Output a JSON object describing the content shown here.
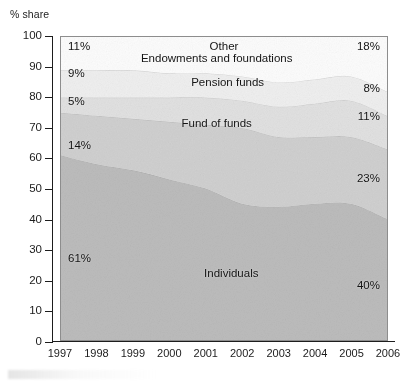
{
  "y_axis_title": "% share",
  "axis": {
    "y_ticks": [
      "0",
      "10",
      "20",
      "30",
      "40",
      "50",
      "60",
      "70",
      "80",
      "90",
      "100"
    ],
    "x_ticks": [
      "1997",
      "1998",
      "1999",
      "2000",
      "2001",
      "2002",
      "2003",
      "2004",
      "2005",
      "2006"
    ]
  },
  "labels": {
    "other": "Other",
    "endowments": "Endowments and foundations",
    "pension": "Pension funds",
    "fund_of_funds": "Fund of funds",
    "individuals": "Individuals"
  },
  "value_labels": {
    "other_start": "11%",
    "other_end": "18%",
    "endowments_start": "9%",
    "endowments_end": "8%",
    "pension_start": "5%",
    "pension_end": "11%",
    "fof_start": "14%",
    "fof_end": "23%",
    "individuals_start": "61%",
    "individuals_end": "40%"
  },
  "colors": {
    "individuals": "#bcbcbc",
    "fund_of_funds": "#d0d0d0",
    "pension_funds": "#e1e1e1",
    "endowments": "#efefef",
    "other": "#fcfcfc",
    "frame": "#8d8d8d",
    "axis": "#1d1d1d",
    "text": "#1a1a1a"
  },
  "chart_data": {
    "type": "area",
    "title": "",
    "subtitle": "",
    "xlabel": "",
    "ylabel": "% share",
    "ylim": [
      0,
      100
    ],
    "xlim": [
      "1997",
      "2006"
    ],
    "grid": false,
    "legend": "in-plot labels",
    "stacked": true,
    "normalized_to_100": true,
    "x": [
      "1997",
      "1998",
      "1999",
      "2000",
      "2001",
      "2002",
      "2003",
      "2004",
      "2005",
      "2006"
    ],
    "series": [
      {
        "name": "Individuals",
        "color": "#bcbcbc",
        "values": [
          61,
          58,
          56,
          53,
          50,
          45,
          44,
          45,
          45,
          40
        ],
        "start_label": "61%",
        "end_label": "40%"
      },
      {
        "name": "Fund of funds",
        "color": "#d0d0d0",
        "values": [
          14,
          16,
          17,
          19,
          21,
          25,
          23,
          22,
          22,
          23
        ],
        "start_label": "14%",
        "end_label": "23%"
      },
      {
        "name": "Pension funds",
        "color": "#e1e1e1",
        "values": [
          5,
          6,
          7,
          8,
          9,
          9,
          10,
          11,
          12,
          11
        ],
        "start_label": "5%",
        "end_label": "11%"
      },
      {
        "name": "Endowments and foundations",
        "color": "#efefef",
        "values": [
          9,
          9,
          9,
          8,
          8,
          8,
          8,
          8,
          8,
          8
        ],
        "start_label": "9%",
        "end_label": "8%"
      },
      {
        "name": "Other",
        "color": "#fcfcfc",
        "values": [
          11,
          11,
          11,
          12,
          12,
          13,
          15,
          14,
          13,
          18
        ],
        "start_label": "11%",
        "end_label": "18%"
      }
    ],
    "annotations": [
      {
        "text": "Other",
        "series": "Other"
      },
      {
        "text": "Endowments and foundations",
        "series": "Endowments and foundations"
      },
      {
        "text": "Pension funds",
        "series": "Pension funds"
      },
      {
        "text": "Fund of funds",
        "series": "Fund of funds"
      },
      {
        "text": "Individuals",
        "series": "Individuals"
      }
    ]
  }
}
